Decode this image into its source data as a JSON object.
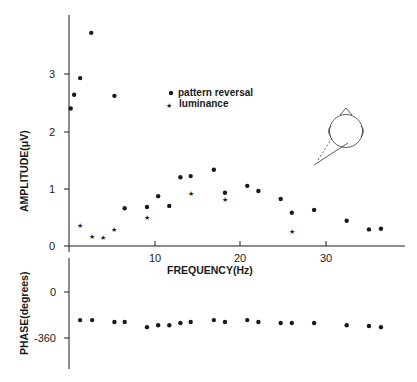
{
  "chart_data": [
    {
      "type": "scatter",
      "panel": "amplitude",
      "title": "",
      "xlabel": "FREQUENCY (Hz)",
      "ylabel": "AMPLITUDE (μV)",
      "xlim": [
        0,
        39
      ],
      "ylim": [
        0,
        3.9
      ],
      "x_ticks": [
        10,
        20,
        30
      ],
      "x_tick_labels": [
        "10",
        "20",
        "30"
      ],
      "y_ticks": [
        0,
        1,
        2,
        3
      ],
      "y_tick_labels": [
        "0",
        "1",
        "2",
        "3"
      ],
      "grid": false,
      "legend_position": "upper center",
      "series": [
        {
          "name": "pattern reversal",
          "marker": "dot",
          "points": [
            [
              0.2,
              2.4
            ],
            [
              0.6,
              2.64
            ],
            [
              1.3,
              2.93
            ],
            [
              2.6,
              3.72
            ],
            [
              5.3,
              2.62
            ],
            [
              6.5,
              0.66
            ],
            [
              9.1,
              0.68
            ],
            [
              10.4,
              0.87
            ],
            [
              11.7,
              0.7
            ],
            [
              13.0,
              1.2
            ],
            [
              14.2,
              1.22
            ],
            [
              16.9,
              1.33
            ],
            [
              18.2,
              0.93
            ],
            [
              20.8,
              1.05
            ],
            [
              22.1,
              0.96
            ],
            [
              24.7,
              0.82
            ],
            [
              26.0,
              0.58
            ],
            [
              28.6,
              0.63
            ],
            [
              32.4,
              0.44
            ],
            [
              35.0,
              0.29
            ],
            [
              36.4,
              0.3
            ]
          ]
        },
        {
          "name": "luminance",
          "marker": "star",
          "points": [
            [
              1.3,
              0.35
            ],
            [
              2.7,
              0.17
            ],
            [
              4.0,
              0.14
            ],
            [
              5.3,
              0.29
            ],
            [
              9.1,
              0.49
            ],
            [
              14.2,
              0.91
            ],
            [
              18.2,
              0.82
            ],
            [
              26.0,
              0.26
            ]
          ]
        }
      ],
      "annotations": [
        "head diagram with electrode position indicator (upper right)"
      ]
    },
    {
      "type": "scatter",
      "panel": "phase",
      "title": "",
      "xlabel": "FREQUENCY (Hz)",
      "ylabel": "PHASE (degrees)",
      "xlim": [
        0,
        39
      ],
      "ylim": [
        -560,
        250
      ],
      "y_ticks": [
        0,
        -360
      ],
      "y_tick_labels": [
        "0",
        "-360"
      ],
      "grid": false,
      "series": [
        {
          "name": "pattern reversal phase",
          "marker": "dot",
          "points": [
            [
              1.3,
              -220
            ],
            [
              2.7,
              -220
            ],
            [
              5.3,
              -235
            ],
            [
              6.5,
              -235
            ],
            [
              9.1,
              -275
            ],
            [
              10.4,
              -260
            ],
            [
              11.7,
              -260
            ],
            [
              13.0,
              -243
            ],
            [
              14.2,
              -235
            ],
            [
              16.9,
              -220
            ],
            [
              18.2,
              -235
            ],
            [
              20.8,
              -220
            ],
            [
              22.1,
              -235
            ],
            [
              24.7,
              -243
            ],
            [
              26.0,
              -243
            ],
            [
              28.6,
              -243
            ],
            [
              32.4,
              -260
            ],
            [
              35.0,
              -266
            ],
            [
              36.4,
              -275
            ]
          ]
        }
      ]
    }
  ],
  "labels": {
    "amp_ylabel": "AMPLITUDE(μV)",
    "phase_ylabel": "PHASE(degrees)",
    "xlabel": "FREQUENCY(Hz)",
    "legend_pattern": "pattern reversal",
    "legend_luminance": "luminance",
    "amp_ticks": [
      "0",
      "1",
      "2",
      "3"
    ],
    "x_ticks": [
      "10",
      "20",
      "30"
    ],
    "phase_ticks": [
      "0",
      "-360"
    ]
  },
  "colors": {
    "ink": "#1a1a1a",
    "background": "#ffffff"
  }
}
